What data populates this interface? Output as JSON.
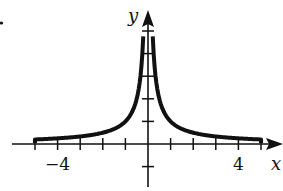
{
  "chart_data": {
    "type": "line",
    "title": "",
    "xlabel": "x",
    "ylabel": "y",
    "function": "y = 1/|x|",
    "xlim": [
      -5.5,
      5.5
    ],
    "ylim": [
      -1.5,
      5.5
    ],
    "x_ticks": [
      -5,
      -4,
      -3,
      -2,
      -1,
      1,
      2,
      3,
      4,
      5
    ],
    "y_ticks": [
      -1,
      1,
      2,
      3,
      4,
      5
    ],
    "tick_labels": [
      {
        "axis": "x",
        "value": -4,
        "text": "−4"
      },
      {
        "axis": "x",
        "value": 4,
        "text": "4"
      }
    ],
    "grid": false,
    "legend": null,
    "series": [
      {
        "name": "left branch",
        "x": [
          -5,
          -4,
          -3,
          -2,
          -1.5,
          -1,
          -0.75,
          -0.5,
          -0.4,
          -0.3,
          -0.25,
          -0.21
        ],
        "y": [
          0.2,
          0.25,
          0.333,
          0.5,
          0.667,
          1,
          1.333,
          2,
          2.5,
          3.333,
          4,
          4.76
        ]
      },
      {
        "name": "right branch",
        "x": [
          0.21,
          0.25,
          0.3,
          0.4,
          0.5,
          0.75,
          1,
          1.5,
          2,
          3,
          4,
          5
        ],
        "y": [
          4.76,
          4,
          3.333,
          2.5,
          2,
          1.333,
          1,
          0.667,
          0.5,
          0.333,
          0.25,
          0.2
        ]
      }
    ],
    "endpoints": "vertical drops to axis at x=±5 (closed ends)"
  },
  "colors": {
    "curve": "#111111",
    "axis": "#111111",
    "background": "#ffffff"
  },
  "marker": {
    "bullet": "•"
  }
}
